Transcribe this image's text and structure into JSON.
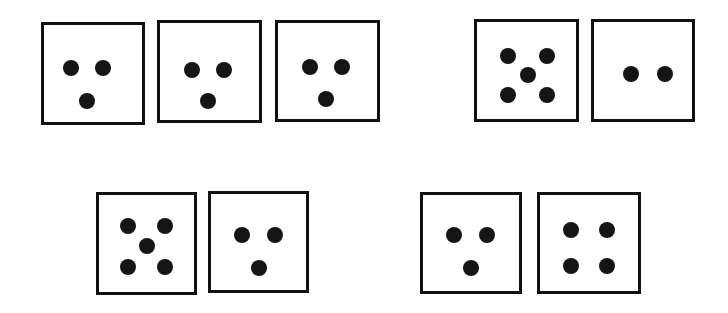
{
  "canvas": {
    "width": 728,
    "height": 313,
    "background_color": "#ffffff"
  },
  "style": {
    "card_border_color": "#111111",
    "card_border_width": 3,
    "card_fill_color": "#ffffff",
    "dot_color": "#151515",
    "dot_diameter": 16
  },
  "groups": [
    {
      "id": "group-top-left",
      "row": "top",
      "position": "left",
      "card_count": 3,
      "dot_counts": [
        3,
        3,
        3
      ]
    },
    {
      "id": "group-top-right",
      "row": "top",
      "position": "right",
      "card_count": 2,
      "dot_counts": [
        5,
        2
      ]
    },
    {
      "id": "group-bottom-left",
      "row": "bottom",
      "position": "left",
      "card_count": 2,
      "dot_counts": [
        5,
        3
      ]
    },
    {
      "id": "group-bottom-right",
      "row": "bottom",
      "position": "right",
      "card_count": 2,
      "dot_counts": [
        3,
        4
      ]
    }
  ],
  "cards": [
    {
      "id": "card-1",
      "group": "group-top-left",
      "index_in_group": 1,
      "dot_count": 3,
      "pattern": "triangle-two-top-one-bottom",
      "x": 41,
      "y": 22,
      "width": 104,
      "height": 103,
      "dots": [
        {
          "cx": 27,
          "cy": 43,
          "d": 16
        },
        {
          "cx": 59,
          "cy": 43,
          "d": 16
        },
        {
          "cx": 43,
          "cy": 76,
          "d": 16
        }
      ]
    },
    {
      "id": "card-2",
      "group": "group-top-left",
      "index_in_group": 2,
      "dot_count": 3,
      "pattern": "triangle-two-top-one-bottom",
      "x": 157,
      "y": 20,
      "width": 105,
      "height": 103,
      "dots": [
        {
          "cx": 32,
          "cy": 47,
          "d": 16
        },
        {
          "cx": 64,
          "cy": 47,
          "d": 16
        },
        {
          "cx": 48,
          "cy": 78,
          "d": 16
        }
      ]
    },
    {
      "id": "card-3",
      "group": "group-top-left",
      "index_in_group": 3,
      "dot_count": 3,
      "pattern": "triangle-two-top-one-bottom",
      "x": 275,
      "y": 20,
      "width": 105,
      "height": 102,
      "dots": [
        {
          "cx": 32,
          "cy": 44,
          "d": 16
        },
        {
          "cx": 64,
          "cy": 44,
          "d": 16
        },
        {
          "cx": 48,
          "cy": 76,
          "d": 16
        }
      ]
    },
    {
      "id": "card-4",
      "group": "group-top-right",
      "index_in_group": 1,
      "dot_count": 5,
      "pattern": "quincunx-four-corners-one-center",
      "x": 474,
      "y": 19,
      "width": 105,
      "height": 103,
      "dots": [
        {
          "cx": 31,
          "cy": 34,
          "d": 16
        },
        {
          "cx": 70,
          "cy": 34,
          "d": 16
        },
        {
          "cx": 51,
          "cy": 53,
          "d": 16
        },
        {
          "cx": 31,
          "cy": 73,
          "d": 16
        },
        {
          "cx": 70,
          "cy": 73,
          "d": 16
        }
      ]
    },
    {
      "id": "card-5",
      "group": "group-top-right",
      "index_in_group": 2,
      "dot_count": 2,
      "pattern": "two-horizontal-centered",
      "x": 591,
      "y": 19,
      "width": 104,
      "height": 103,
      "dots": [
        {
          "cx": 37,
          "cy": 52,
          "d": 16
        },
        {
          "cx": 71,
          "cy": 52,
          "d": 16
        }
      ]
    },
    {
      "id": "card-6",
      "group": "group-bottom-left",
      "index_in_group": 1,
      "dot_count": 5,
      "pattern": "quincunx-four-corners-one-center",
      "x": 96,
      "y": 192,
      "width": 101,
      "height": 103,
      "dots": [
        {
          "cx": 29,
          "cy": 31,
          "d": 16
        },
        {
          "cx": 66,
          "cy": 31,
          "d": 16
        },
        {
          "cx": 48,
          "cy": 51,
          "d": 16
        },
        {
          "cx": 29,
          "cy": 72,
          "d": 16
        },
        {
          "cx": 66,
          "cy": 72,
          "d": 16
        }
      ]
    },
    {
      "id": "card-7",
      "group": "group-bottom-left",
      "index_in_group": 2,
      "dot_count": 3,
      "pattern": "triangle-two-top-one-bottom",
      "x": 208,
      "y": 191,
      "width": 101,
      "height": 102,
      "dots": [
        {
          "cx": 31,
          "cy": 41,
          "d": 16
        },
        {
          "cx": 64,
          "cy": 41,
          "d": 16
        },
        {
          "cx": 48,
          "cy": 74,
          "d": 16
        }
      ]
    },
    {
      "id": "card-8",
      "group": "group-bottom-right",
      "index_in_group": 1,
      "dot_count": 3,
      "pattern": "triangle-two-top-one-bottom",
      "x": 420,
      "y": 192,
      "width": 102,
      "height": 102,
      "dots": [
        {
          "cx": 31,
          "cy": 40,
          "d": 16
        },
        {
          "cx": 64,
          "cy": 40,
          "d": 16
        },
        {
          "cx": 48,
          "cy": 73,
          "d": 16
        }
      ]
    },
    {
      "id": "card-9",
      "group": "group-bottom-right",
      "index_in_group": 2,
      "dot_count": 4,
      "pattern": "square-two-by-two",
      "x": 537,
      "y": 192,
      "width": 104,
      "height": 102,
      "dots": [
        {
          "cx": 31,
          "cy": 35,
          "d": 16
        },
        {
          "cx": 67,
          "cy": 35,
          "d": 16
        },
        {
          "cx": 31,
          "cy": 71,
          "d": 16
        },
        {
          "cx": 67,
          "cy": 71,
          "d": 16
        }
      ]
    }
  ]
}
